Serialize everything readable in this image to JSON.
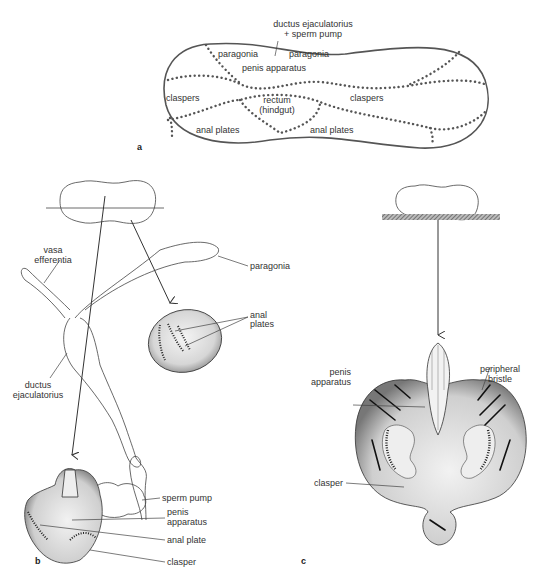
{
  "figure": {
    "panel_a": {
      "letter": "a",
      "top_label_line1": "ductus ejaculatorius",
      "top_label_line2": "+ sperm pump",
      "regions": {
        "paragonia_left": "paragonia",
        "paragonia_right": "paragonia",
        "penis_apparatus": "penis apparatus",
        "claspers_left": "claspers",
        "claspers_right": "claspers",
        "rectum_line1": "rectum",
        "rectum_line2": "(hindgut)",
        "anal_plates_left": "anal plates",
        "anal_plates_right": "anal plates"
      }
    },
    "panel_b": {
      "letter": "b",
      "labels": {
        "vasa_line1": "vasa",
        "vasa_line2": "efferentia",
        "paragonia": "paragonia",
        "anal_plates_line1": "anal",
        "anal_plates_line2": "plates",
        "ductus_line1": "ductus",
        "ductus_line2": "ejaculatorius",
        "sperm_pump": "sperm pump",
        "penis_line1": "penis",
        "penis_line2": "apparatus",
        "anal_plate": "anal plate",
        "clasper": "clasper"
      }
    },
    "panel_c": {
      "letter": "c",
      "labels": {
        "penis_line1": "penis",
        "penis_line2": "apparatus",
        "peripheral_line1": "peripheral",
        "peripheral_line2": "bristle",
        "clasper": "clasper"
      }
    }
  }
}
